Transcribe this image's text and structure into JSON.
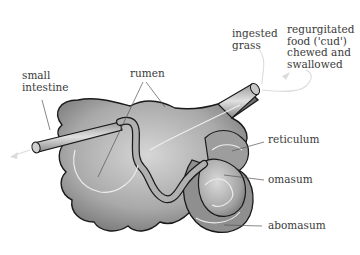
{
  "diagram": {
    "colors": {
      "organ_fill": "#b8b8b8",
      "organ_dark": "#7a7a7a",
      "outline": "#1a1a1a",
      "leader": "#555555",
      "flow_arrow": "#e8e8e8",
      "text": "#3a3a3a",
      "background": "#ffffff"
    },
    "labels": {
      "small_intestine": [
        "small",
        "intestine"
      ],
      "rumen": "rumen",
      "ingested_grass": [
        "ingested",
        "grass"
      ],
      "regurgitated": [
        "regurgitated",
        "food ('cud')",
        "chewed and",
        "swallowed"
      ],
      "reticulum": "reticulum",
      "omasum": "omasum",
      "abomasum": "abomasum"
    }
  }
}
